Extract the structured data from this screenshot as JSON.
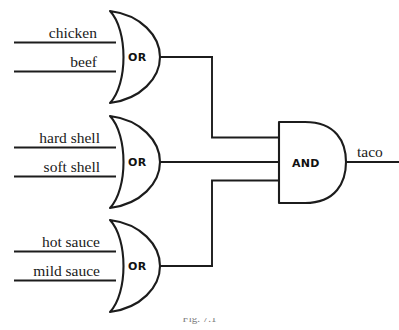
{
  "diagram": {
    "caption": "Fig. 7.1",
    "colors": {
      "stroke": "#1c1c1c",
      "background": "#ffffff",
      "label_text": "#1a1a1a"
    },
    "gates": [
      {
        "id": "or-gate-meat",
        "type": "OR",
        "label": "OR",
        "inputs": [
          "chicken",
          "beef"
        ]
      },
      {
        "id": "or-gate-shell",
        "type": "OR",
        "label": "OR",
        "inputs": [
          "hard shell",
          "soft shell"
        ]
      },
      {
        "id": "or-gate-sauce",
        "type": "OR",
        "label": "OR",
        "inputs": [
          "hot sauce",
          "mild sauce"
        ]
      },
      {
        "id": "and-gate-taco",
        "type": "AND",
        "label": "AND",
        "inputs": [
          "or-gate-meat",
          "or-gate-shell",
          "or-gate-sauce"
        ],
        "output": "taco"
      }
    ],
    "input_labels": {
      "chicken": "chicken",
      "beef": "beef",
      "hard_shell": "hard shell",
      "soft_shell": "soft shell",
      "hot_sauce": "hot sauce",
      "mild_sauce": "mild sauce"
    },
    "output_label": "taco"
  }
}
